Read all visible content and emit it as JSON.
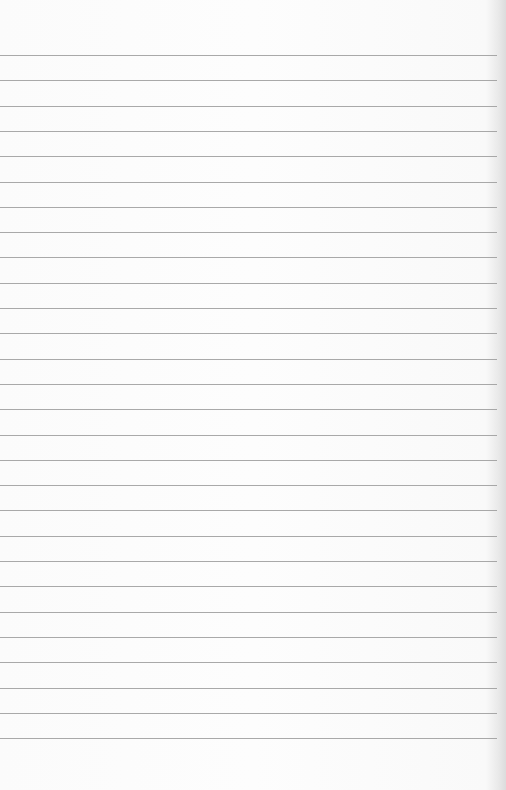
{
  "paper": {
    "type": "lined-notebook-paper",
    "background_color": "#fafafa",
    "line_color": "#9a9a9a",
    "line_count": 28,
    "first_line_y": 55,
    "line_spacing": 25.3,
    "line_width": 497,
    "text": ""
  }
}
